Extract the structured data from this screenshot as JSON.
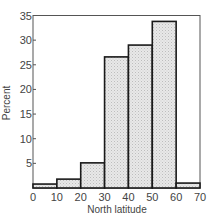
{
  "chart_data": {
    "type": "bar",
    "subtype": "histogram",
    "title": "",
    "xlabel": "North latitude",
    "ylabel": "Percent",
    "bins": [
      [
        0,
        10
      ],
      [
        10,
        20
      ],
      [
        20,
        30
      ],
      [
        30,
        40
      ],
      [
        40,
        50
      ],
      [
        50,
        60
      ],
      [
        60,
        70
      ]
    ],
    "categories": [
      "0-10",
      "10-20",
      "20-30",
      "30-40",
      "40-50",
      "50-60",
      "60-70"
    ],
    "values": [
      0.8,
      1.8,
      5.1,
      26.6,
      29.0,
      33.8,
      1.0
    ],
    "xlim": [
      0,
      70
    ],
    "ylim": [
      0,
      35
    ],
    "xticks": [
      0,
      10,
      20,
      30,
      40,
      50,
      60,
      70
    ],
    "yticks": [
      5,
      10,
      15,
      20,
      25,
      30,
      35
    ],
    "xtick_labels": [
      "0",
      "10",
      "20",
      "30",
      "40",
      "50",
      "60",
      "70"
    ],
    "ytick_labels": [
      "5",
      "10",
      "15",
      "20",
      "25",
      "30",
      "35"
    ],
    "grid": false,
    "legend": null,
    "frame": "box",
    "colors": {
      "bar_fill": "#e6e6e6",
      "bar_stipple": "#b8b8b8",
      "bar_edge": "#1a1a1a",
      "axis": "#555555"
    }
  }
}
